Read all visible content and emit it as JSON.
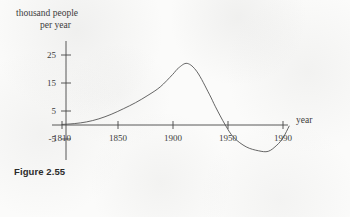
{
  "figure": {
    "caption": "Figure 2.55"
  },
  "chart_data": {
    "type": "line",
    "title": "",
    "subtitle": "",
    "ylabel_line1": "thousand people",
    "ylabel_line2": "per year",
    "xlabel": "year",
    "grid": false,
    "legend": "none",
    "xlim": [
      1803,
      1997
    ],
    "ylim": [
      -11,
      28
    ],
    "xticks": [
      1810,
      1850,
      1900,
      1950,
      1990
    ],
    "xtick_labels": [
      "1810",
      "1850",
      "1900",
      "1950",
      "1990"
    ],
    "yticks": [
      25,
      15,
      5,
      -5
    ],
    "ytick_labels": [
      "25",
      "15",
      "5",
      "-5"
    ],
    "annotations": [],
    "series": [
      {
        "name": "net immigration rate",
        "x": [
          1810,
          1820,
          1830,
          1840,
          1850,
          1860,
          1870,
          1880,
          1890,
          1900,
          1905,
          1912,
          1920,
          1930,
          1935,
          1943,
          1950,
          1960,
          1970,
          1978,
          1985,
          1990,
          1995
        ],
        "values": [
          0.2,
          0.5,
          1.1,
          2.2,
          3.8,
          5.8,
          8.0,
          10.6,
          13.6,
          18.0,
          20.4,
          22.0,
          19.0,
          11.0,
          6.5,
          0.0,
          -4.5,
          -7.8,
          -9.2,
          -9.4,
          -7.2,
          -4.6,
          -0.4
        ]
      }
    ]
  }
}
